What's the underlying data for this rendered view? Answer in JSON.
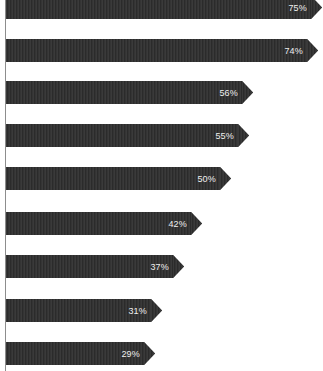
{
  "chart_data": {
    "type": "bar",
    "orientation": "horizontal",
    "title": "",
    "subtitle": "",
    "xlabel": "",
    "ylabel": "",
    "grid": false,
    "legend": null,
    "legend_position": "none",
    "axis": {
      "category_axis_visible": true,
      "value_axis_visible": false,
      "xlim": [
        0,
        80
      ]
    },
    "style": {
      "bar_color": "#333333",
      "bar_texture": "vertical-stripes",
      "label_color": "#efefef",
      "background": "#ffffff",
      "axis_line_color": "#8d8d8d",
      "bar_shape": "arrow"
    },
    "categories": [
      "",
      "",
      "",
      "",
      "",
      "",
      "",
      "",
      ""
    ],
    "values": [
      75,
      74,
      56,
      55,
      50,
      42,
      37,
      31,
      29
    ],
    "data_labels": [
      "75%",
      "74%",
      "56%",
      "55%",
      "50%",
      "42%",
      "37%",
      "31%",
      "29%"
    ],
    "bars": [
      {
        "label": "75%",
        "value": 75,
        "top": -4,
        "height": 23,
        "end_x": 311
      },
      {
        "label": "74%",
        "value": 74,
        "top": 39,
        "height": 23,
        "end_x": 307
      },
      {
        "label": "56%",
        "value": 56,
        "top": 81,
        "height": 23,
        "end_x": 242
      },
      {
        "label": "55%",
        "value": 55,
        "top": 124,
        "height": 23,
        "end_x": 238
      },
      {
        "label": "50%",
        "value": 50,
        "top": 167,
        "height": 23,
        "end_x": 220
      },
      {
        "label": "42%",
        "value": 42,
        "top": 212,
        "height": 23,
        "end_x": 191
      },
      {
        "label": "37%",
        "value": 37,
        "top": 255,
        "height": 23,
        "end_x": 173
      },
      {
        "label": "31%",
        "value": 31,
        "top": 299,
        "height": 23,
        "end_x": 151
      },
      {
        "label": "29%",
        "value": 29,
        "top": 342,
        "height": 23,
        "end_x": 144
      }
    ]
  }
}
